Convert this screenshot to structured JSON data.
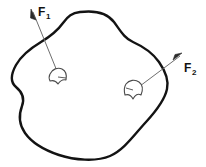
{
  "figure": {
    "name": "rigid-body-force-diagram",
    "background_color": "#ffffff",
    "outline_color": "#131313",
    "leader_color": "#6e6e6e",
    "patch_color": "#4a4a4a",
    "label_color": "#121212",
    "body": {
      "name": "irregular-rigid-body",
      "description": "closed irregular blob outline"
    },
    "forces": [
      {
        "id": "F1",
        "base": "F",
        "subscript": "1",
        "label_text": "F",
        "subscript_text": "1",
        "label_x": 38,
        "label_y": 16,
        "sub_x": 47,
        "sub_y": 19,
        "arrow_tip_x": 31,
        "arrow_tip_y": 9,
        "arrow_tail_x": 59,
        "arrow_tail_y": 76,
        "patch_center_x": 58,
        "patch_center_y": 77
      },
      {
        "id": "F2",
        "base": "F",
        "subscript": "2",
        "label_text": "F",
        "subscript_text": "2",
        "label_x": 184,
        "label_y": 72,
        "sub_x": 193,
        "sub_y": 75,
        "arrow_tip_x": 181,
        "arrow_tip_y": 54,
        "arrow_tail_x": 137,
        "arrow_tail_y": 89,
        "patch_center_x": 134,
        "patch_center_y": 91
      }
    ]
  }
}
